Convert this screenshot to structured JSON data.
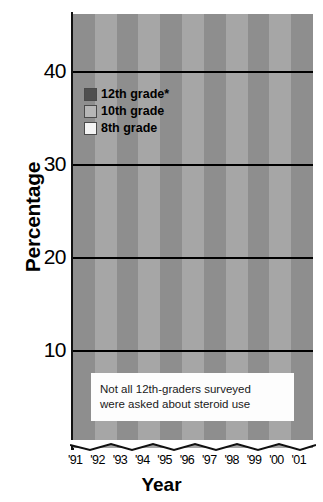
{
  "chart_data": {
    "type": "line",
    "title": "",
    "xlabel": "Year",
    "ylabel": "Percentage",
    "ylim": [
      5,
      45
    ],
    "yticks": [
      10,
      20,
      30,
      40
    ],
    "grid": true,
    "legend_position": "top-left",
    "categories": [
      "'91",
      "'92",
      "'93",
      "'94",
      "'95",
      "'96",
      "'97",
      "'98",
      "'99",
      "'00",
      "'01"
    ],
    "x": [
      "'91",
      "'92",
      "'93",
      "'94",
      "'95",
      "'96",
      "'97",
      "'98",
      "'99",
      "'00",
      "'01"
    ],
    "series": [
      {
        "name": "12th grade*",
        "color": "#4f4f4f",
        "values": [
          20.8,
          21.0,
          19.9,
          24.2,
          22.6,
          19.8,
          20.7,
          21.0,
          29.0,
          25.5,
          37.0
        ]
      },
      {
        "name": "10th grade",
        "color": "#b6b6b6",
        "values": [
          18.6,
          17.6,
          17.0,
          19.6,
          19.6,
          18.4,
          18.0,
          21.2,
          29.2,
          35.0,
          35.2
        ]
      },
      {
        "name": "8th grade",
        "color": "#f2f2f2",
        "values": [
          19.0,
          18.0,
          16.3,
          20.0,
          19.3,
          18.8,
          20.6,
          21.0,
          29.0,
          30.2,
          28.4
        ]
      }
    ],
    "annotations": [
      "Not all 12th-graders surveyed",
      "were asked about steroid use"
    ]
  },
  "axes": {
    "y_title": "Percentage",
    "x_title": "Year",
    "y_ticks": [
      "40",
      "30",
      "20",
      "10"
    ],
    "x_ticks": [
      "'91",
      "'92",
      "'93",
      "'94",
      "'95",
      "'96",
      "'97",
      "'98",
      "'99",
      "'00",
      "'01"
    ]
  },
  "legend": {
    "items": [
      {
        "label": "12th grade*",
        "color": "#4f4f4f"
      },
      {
        "label": "10th grade",
        "color": "#b6b6b6"
      },
      {
        "label": "8th grade",
        "color": "#f4f4f4"
      }
    ]
  },
  "footnote": {
    "line1": "Not all 12th-graders surveyed",
    "line2": "were asked about steroid use"
  },
  "style": {
    "band_dark": "#8e8e8e",
    "band_light": "#a6a6a6",
    "grid_color": "#000000",
    "page_bg": "#ffffff"
  }
}
